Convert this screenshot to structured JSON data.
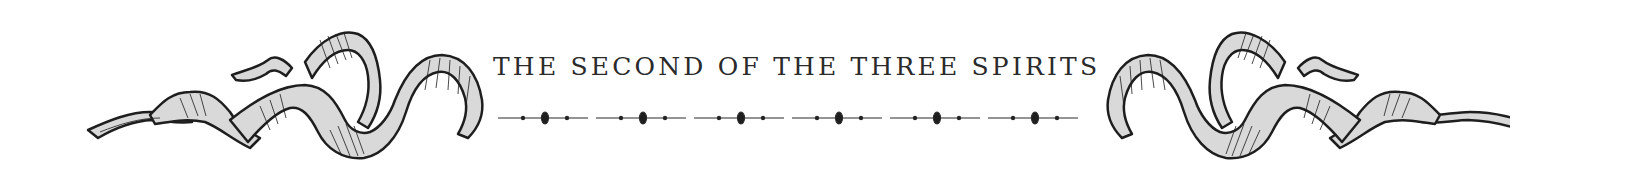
{
  "heading": {
    "title": "THE SECOND OF THE THREE SPIRITS"
  },
  "ornaments": {
    "left": "ribbon-flourish-icon",
    "right": "ribbon-flourish-icon-mirrored",
    "divider": "dotted-rule-divider"
  },
  "divider": {
    "segments": 6
  },
  "colors": {
    "ink": "#2a2a2a",
    "ribbon_fill": "#d9d9d9",
    "background": "#ffffff"
  }
}
